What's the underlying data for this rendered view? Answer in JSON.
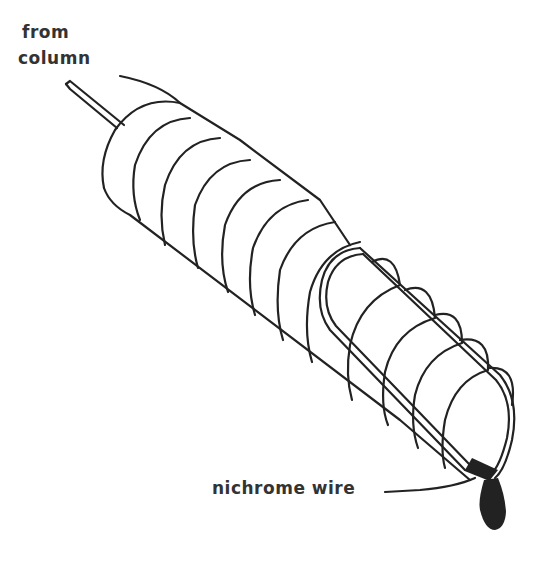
{
  "diagram": {
    "labels": {
      "inlet_line1": "from",
      "inlet_line2": "column",
      "wire": "nichrome wire"
    },
    "colors": {
      "line": "#222222",
      "text": "#333333",
      "background": "#ffffff"
    }
  }
}
